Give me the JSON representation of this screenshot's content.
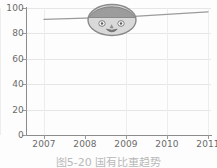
{
  "chart_data": {
    "type": "line",
    "title": "",
    "subtitle": "",
    "xlabel": "",
    "ylabel": "",
    "categories": [
      "2007",
      "2008",
      "2009",
      "2010",
      "2011"
    ],
    "x": [
      "2007",
      "2008",
      "2009",
      "2010",
      "2011"
    ],
    "series": [
      {
        "name": "series-1",
        "values": [
          91,
          92,
          93,
          95,
          97
        ],
        "color": "#9b9b9b"
      }
    ],
    "values": [
      91,
      92,
      93,
      95,
      97
    ],
    "ylim": [
      0,
      100
    ],
    "yticks": [
      0,
      20,
      40,
      60,
      80,
      100
    ],
    "ytick_labels": [
      "0",
      "20",
      "40",
      "60",
      "80",
      "100"
    ],
    "xtick_labels": [
      "2007",
      "2008",
      "2009",
      "2010",
      "2011"
    ],
    "grid": true,
    "grid_axis": "both",
    "legend": false,
    "legend_position": "none",
    "annotations": [
      {
        "kind": "doodle",
        "name": "smiley-face-doodle",
        "description": "hand-drawn round face with dark hair, two eyes and a smiling mouth",
        "near_category": "2009",
        "near_value": 92
      }
    ]
  },
  "axes": {
    "y_ticks": [
      {
        "label": "100",
        "value": 100
      },
      {
        "label": "80",
        "value": 80
      },
      {
        "label": "60",
        "value": 60
      },
      {
        "label": "40",
        "value": 40
      },
      {
        "label": "20",
        "value": 20
      },
      {
        "label": "0",
        "value": 0
      }
    ],
    "x_ticks": [
      {
        "label": "2007"
      },
      {
        "label": "2008"
      },
      {
        "label": "2009"
      },
      {
        "label": "2010"
      },
      {
        "label": "2011"
      }
    ]
  },
  "caption": {
    "text": "图5-20  国有比重趋势",
    "visible_note": "clipped at bottom edge of image"
  },
  "colors": {
    "line": "#9b9b9b",
    "axis": "#8c8c8c",
    "grid": "#e6e6e6",
    "tick_text": "#6b6b6b",
    "doodle_outline": "#8a8a8a",
    "doodle_hair": "#9c9c9c",
    "doodle_face": "#d8d8d8",
    "background": "#fdfdfd"
  }
}
